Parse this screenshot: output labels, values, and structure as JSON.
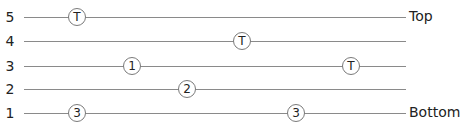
{
  "rows": [
    {
      "label": "5",
      "y": 17,
      "end_label": "Top",
      "markers": [
        {
          "text": "T",
          "x": 77
        }
      ]
    },
    {
      "label": "4",
      "y": 41,
      "end_label": "",
      "markers": [
        {
          "text": "T",
          "x": 242
        }
      ]
    },
    {
      "label": "3",
      "y": 66,
      "end_label": "",
      "markers": [
        {
          "text": "1",
          "x": 132
        },
        {
          "text": "T",
          "x": 351
        }
      ]
    },
    {
      "label": "2",
      "y": 89,
      "end_label": "",
      "markers": [
        {
          "text": "2",
          "x": 187
        }
      ]
    },
    {
      "label": "1",
      "y": 113,
      "end_label": "Bottom",
      "markers": [
        {
          "text": "3",
          "x": 77
        },
        {
          "text": "3",
          "x": 296
        }
      ]
    }
  ],
  "colors": {
    "line": "#8a8a8a",
    "text": "#222222",
    "marker_border": "#7a7a7a"
  }
}
